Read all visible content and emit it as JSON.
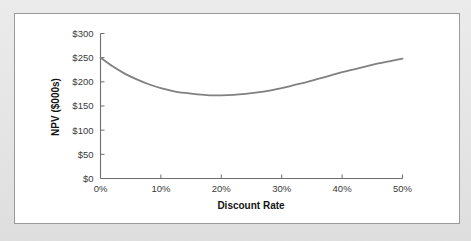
{
  "figure": {
    "panel_background": "#ffffff",
    "page_background": "#e7e7e7",
    "border_color": "#9a9a9a"
  },
  "chart_data": {
    "type": "line",
    "title": "",
    "subtitle": "",
    "xlabel": "Discount Rate",
    "ylabel": "NPV ($000s)",
    "xlim": [
      0,
      50
    ],
    "ylim": [
      0,
      300
    ],
    "grid": false,
    "legend": null,
    "legend_position": "none",
    "line_color": "#808080",
    "line_width": 1.8,
    "axis_color": "#6e6e6e",
    "x_ticks": [
      0,
      10,
      20,
      30,
      40,
      50
    ],
    "x_tick_labels": [
      "0%",
      "10%",
      "20%",
      "30%",
      "40%",
      "50%"
    ],
    "y_ticks": [
      0,
      50,
      100,
      150,
      200,
      250,
      300
    ],
    "y_tick_labels": [
      "$0",
      "$50",
      "$100",
      "$150",
      "$200",
      "$250",
      "$300"
    ],
    "series": [
      {
        "name": "NPV vs Discount Rate",
        "x": [
          0,
          2,
          4,
          6,
          8,
          10,
          12,
          14,
          16,
          18,
          20,
          22,
          24,
          26,
          28,
          30,
          32,
          34,
          36,
          38,
          40,
          42,
          44,
          46,
          48,
          50
        ],
        "values": [
          250,
          232,
          217,
          205,
          195,
          187,
          181,
          177,
          174,
          172,
          172,
          173,
          175,
          178,
          182,
          187,
          193,
          199,
          206,
          213,
          220,
          226,
          232,
          238,
          243,
          248
        ]
      }
    ],
    "annotations": {
      "minimum_point": {
        "x": 19,
        "y": 172,
        "label": ""
      },
      "start_point": {
        "x": 0,
        "y": 250
      },
      "end_point": {
        "x": 50,
        "y": 248
      }
    },
    "axis_label_font_size": 9.5,
    "axis_title_font_size": 10
  },
  "x_axis_title": "Discount Rate",
  "y_axis_title": "NPV ($000s)"
}
